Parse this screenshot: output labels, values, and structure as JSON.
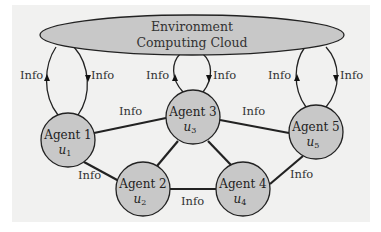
{
  "diagram": {
    "type": "multi-agent communication graph",
    "cloud": {
      "line1": "Environment",
      "line2": "Computing Cloud"
    },
    "agents": [
      {
        "id": 1,
        "name": "Agent 1",
        "var": "u",
        "sub": "1"
      },
      {
        "id": 2,
        "name": "Agent 2",
        "var": "u",
        "sub": "2"
      },
      {
        "id": 3,
        "name": "Agent 3",
        "var": "u",
        "sub": "3"
      },
      {
        "id": 4,
        "name": "Agent 4",
        "var": "u",
        "sub": "4"
      },
      {
        "id": 5,
        "name": "Agent 5",
        "var": "u",
        "sub": "5"
      }
    ],
    "edges": [
      {
        "from": 1,
        "to": 3,
        "label": "Info"
      },
      {
        "from": 3,
        "to": 5,
        "label": "Info"
      },
      {
        "from": 1,
        "to": 2,
        "label": "Info"
      },
      {
        "from": 2,
        "to": 4,
        "label": "Info"
      },
      {
        "from": 4,
        "to": 5,
        "label": "Info"
      },
      {
        "from": 2,
        "to": 3,
        "label": ""
      },
      {
        "from": 3,
        "to": 4,
        "label": ""
      }
    ],
    "cloud_links": [
      {
        "agent": 1,
        "up_label": "Info",
        "down_label": "Info"
      },
      {
        "agent": 3,
        "up_label": "Info",
        "down_label": "Info"
      },
      {
        "agent": 5,
        "up_label": "Info",
        "down_label": "Info"
      }
    ],
    "colors": {
      "background": "#f1f1f0",
      "node_fill": "#c8c8c8",
      "cloud_fill": "#c8c8c8",
      "stroke": "#222222"
    }
  }
}
